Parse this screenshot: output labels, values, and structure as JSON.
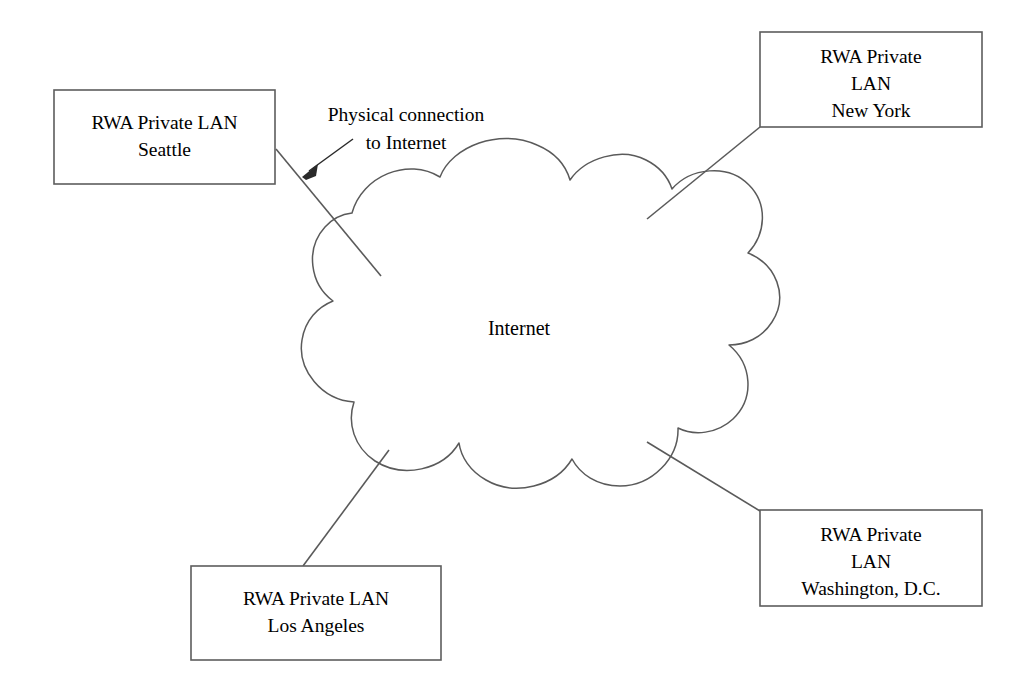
{
  "diagram": {
    "background_color": "#ffffff",
    "line_color": "#5a5a5a",
    "text_color": "#000000",
    "cloud": {
      "label": "Internet",
      "fill": "#ffffff",
      "stroke": "#5a5a5a"
    },
    "annotation": {
      "line1": "Physical connection",
      "line2": "to Internet",
      "target": "seattle-connector"
    },
    "nodes": [
      {
        "id": "seattle",
        "lines": [
          "RWA Private LAN",
          "Seattle"
        ],
        "x": 54,
        "y": 90,
        "width": 221,
        "height": 94
      },
      {
        "id": "new-york",
        "lines": [
          "RWA Private",
          "LAN",
          "New York"
        ],
        "x": 760,
        "y": 32,
        "width": 222,
        "height": 95
      },
      {
        "id": "washington-dc",
        "lines": [
          "RWA Private",
          "LAN",
          "Washington, D.C."
        ],
        "x": 760,
        "y": 510,
        "width": 222,
        "height": 96
      },
      {
        "id": "los-angeles",
        "lines": [
          "RWA Private LAN",
          "Los Angeles"
        ],
        "x": 191,
        "y": 566,
        "width": 250,
        "height": 94
      }
    ],
    "connectors": [
      {
        "id": "seattle-connector",
        "from": "seattle",
        "to": "cloud"
      },
      {
        "id": "new-york-connector",
        "from": "new-york",
        "to": "cloud"
      },
      {
        "id": "washington-dc-connector",
        "from": "washington-dc",
        "to": "cloud"
      },
      {
        "id": "los-angeles-connector",
        "from": "los-angeles",
        "to": "cloud"
      }
    ]
  }
}
